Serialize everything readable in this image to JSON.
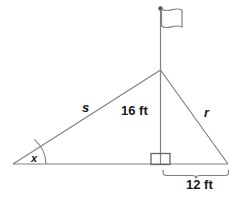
{
  "figure": {
    "type": "geometry-diagram",
    "colors": {
      "stroke": "#808080",
      "text": "#1a1a1a",
      "background": "#ffffff",
      "vertex_dot": "#555555"
    },
    "labels": {
      "height": "16 ft",
      "base": "12 ft",
      "hypotenuse_left": "s",
      "hypotenuse_right": "r",
      "angle": "x"
    },
    "icons": {
      "flag": "flag-icon",
      "right_angle": "right-angle-marker-icon",
      "angle_arc": "angle-arc-icon",
      "brace": "curly-brace-icon",
      "pole_top_dot": "pole-top-dot-icon"
    },
    "geometry": {
      "left_vertex": [
        13,
        164
      ],
      "apex": [
        160,
        70
      ],
      "right_vertex": [
        228,
        164
      ],
      "foot": [
        160,
        164
      ],
      "pole_top": [
        160,
        8
      ],
      "height_segment": "16 ft",
      "base_segment": "12 ft"
    }
  }
}
